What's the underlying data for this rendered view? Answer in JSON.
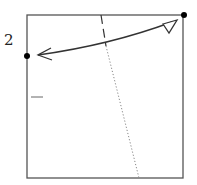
{
  "diagram": {
    "type": "origami-fold-step",
    "step_number": "2",
    "colors": {
      "paper_edge": "#444444",
      "arrow": "#333333",
      "dot": "#000000",
      "crease": "#777777"
    },
    "elements": [
      {
        "kind": "square",
        "label": "paper"
      },
      {
        "kind": "dot",
        "label": "left-edge-reference-point"
      },
      {
        "kind": "dot",
        "label": "top-right-corner"
      },
      {
        "kind": "valley-fold-line",
        "style": "dashed"
      },
      {
        "kind": "crease-line",
        "style": "dotted"
      },
      {
        "kind": "double-arrow",
        "label": "fold-corner-to-point"
      },
      {
        "kind": "tick-mark",
        "label": "edge-mark"
      }
    ]
  }
}
